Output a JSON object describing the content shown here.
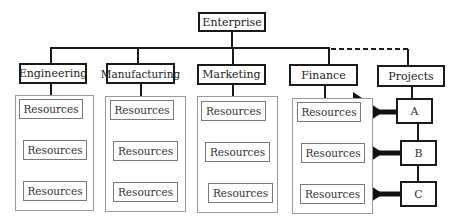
{
  "diagram": {
    "root": {
      "label": "Enterprise"
    },
    "departments": [
      {
        "label": "Engineering",
        "resources": [
          "Resources",
          "Resources",
          "Resources"
        ]
      },
      {
        "label": "Manufacturing",
        "resources": [
          "Resources",
          "Resources",
          "Resources"
        ]
      },
      {
        "label": "Marketing",
        "resources": [
          "Resources",
          "Resources",
          "Resources"
        ]
      },
      {
        "label": "Finance",
        "resources": [
          "Resources",
          "Resources",
          "Resources"
        ]
      }
    ],
    "projects": {
      "label": "Projects",
      "items": [
        {
          "label": "A"
        },
        {
          "label": "B"
        },
        {
          "label": "C"
        }
      ],
      "link_style": "dashed"
    },
    "colors": {
      "line": "#1a1a1a",
      "container_border": "#9a9a9a",
      "resource_border": "#7a7a7a"
    }
  }
}
